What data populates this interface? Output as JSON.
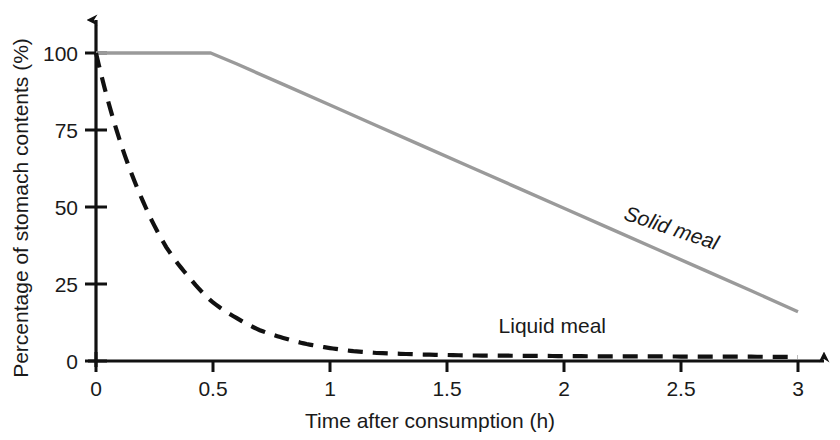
{
  "chart_data": {
    "type": "line",
    "title": "",
    "subtitle": "",
    "xlabel": "Time after consumption (h)",
    "ylabel": "Percentage of stomach contents (%)",
    "xlim": [
      0,
      3
    ],
    "ylim": [
      0,
      100
    ],
    "xticks": [
      "0",
      "0.5",
      "1",
      "1.5",
      "2",
      "2.5",
      "3"
    ],
    "xtick_values": [
      0,
      0.5,
      1,
      1.5,
      2,
      2.5,
      3
    ],
    "yticks": [
      "0",
      "25",
      "50",
      "75",
      "100"
    ],
    "ytick_values": [
      0,
      25,
      50,
      75,
      100
    ],
    "grid": false,
    "legend_position": "inline-annotation",
    "axis_style": "open-arrows",
    "series": [
      {
        "name": "Solid meal",
        "label": "Solid meal",
        "style": "solid",
        "color": "#9a9a9a",
        "x": [
          0,
          0.1,
          0.2,
          0.3,
          0.4,
          0.49,
          0.6,
          0.8,
          1.0,
          1.2,
          1.4,
          1.6,
          1.8,
          2.0,
          2.2,
          2.4,
          2.6,
          2.8,
          3.0
        ],
        "values": [
          100,
          100,
          100,
          100,
          100,
          100,
          96.5,
          89.8,
          83.1,
          76.4,
          69.7,
          63.0,
          56.3,
          49.6,
          42.9,
          36.2,
          29.5,
          22.8,
          16.0
        ],
        "annotation": {
          "text": "Solid meal",
          "x": 2.45,
          "y": 41,
          "rotation": 18.5
        }
      },
      {
        "name": "Liquid meal",
        "label": "Liquid meal",
        "style": "dashed",
        "color": "#111111",
        "x": [
          0,
          0.1,
          0.2,
          0.3,
          0.4,
          0.5,
          0.6,
          0.7,
          0.8,
          0.9,
          1.0,
          1.1,
          1.2,
          1.4,
          1.6,
          1.8,
          2.0,
          2.2,
          2.4,
          2.6,
          2.8,
          3.0
        ],
        "values": [
          100,
          72,
          52,
          37,
          27,
          19,
          14,
          10,
          7.5,
          5.5,
          4.2,
          3.2,
          2.6,
          2.1,
          1.8,
          1.7,
          1.6,
          1.5,
          1.5,
          1.4,
          1.4,
          1.3
        ],
        "annotation": {
          "text": "Liquid meal",
          "x": 1.95,
          "y": 9,
          "rotation": 0
        }
      }
    ]
  },
  "axes": {
    "x_axis_name": "time-axis",
    "y_axis_name": "percentage-axis"
  }
}
